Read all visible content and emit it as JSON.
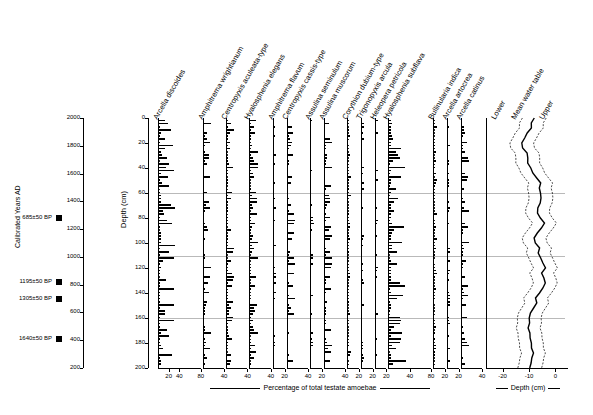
{
  "chart_data": {
    "type": "bar",
    "title": "",
    "subtitle": "",
    "ylabel": "Depth (cm)",
    "ylabel_secondary": "Calibrated Years AD",
    "xlabel_main": "Percentage of total testate amoebae",
    "xlabel_right": "Depth (cm)",
    "ylim": [
      0,
      200
    ],
    "yticks": [
      0,
      20,
      40,
      60,
      80,
      100,
      120,
      140,
      160,
      180,
      200
    ],
    "year_ticks": [
      2000,
      1800,
      1600,
      1400,
      1200,
      1000,
      800,
      600,
      400,
      200
    ],
    "gridlines_depth": [
      60,
      110,
      160
    ],
    "taxa": [
      {
        "name": "Arcella discoides",
        "xmax": 80,
        "xticks": [
          20,
          40,
          80
        ]
      },
      {
        "name": "Amphitrema wrightianum",
        "xmax": 40,
        "xticks": [
          40
        ]
      },
      {
        "name": "Centropyxis aculeata-type",
        "xmax": 40,
        "xticks": [
          40
        ]
      },
      {
        "name": "Hyalosphenia elegans",
        "xmax": 40,
        "xticks": [
          40
        ]
      },
      {
        "name": "Amphitrema flavum",
        "xmax": 20,
        "xticks": [
          20
        ]
      },
      {
        "name": "Centropyxis cassis-type",
        "xmax": 40,
        "xticks": [
          40
        ]
      },
      {
        "name": "Assulina seminulum",
        "xmax": 20,
        "xticks": [
          20
        ]
      },
      {
        "name": "Assulina muscorum",
        "xmax": 40,
        "xticks": [
          40
        ]
      },
      {
        "name": "Corythion dubium-type",
        "xmax": 20,
        "xticks": [
          20
        ]
      },
      {
        "name": "Trigonopyxis arcula",
        "xmax": 20,
        "xticks": [
          20
        ]
      },
      {
        "name": "Heleopera petricola",
        "xmax": 20,
        "xticks": [
          20
        ]
      },
      {
        "name": "Hyalosphenia subflava",
        "xmax": 80,
        "xticks": [
          40,
          80
        ]
      },
      {
        "name": "Bullinularia indica",
        "xmax": 20,
        "xticks": [
          20
        ]
      },
      {
        "name": "Arcella artocrea",
        "xmax": 20,
        "xticks": [
          20
        ]
      },
      {
        "name": "Arcella catinus",
        "xmax": 40,
        "xticks": [
          40
        ]
      }
    ],
    "water_table": {
      "series": [
        "Lower",
        "Mean water table",
        "Upper"
      ],
      "xticks": [
        -20,
        -10,
        0
      ],
      "xlabel": "Depth (cm)"
    },
    "radiocarbon_dates": [
      {
        "label": "685±50 BP",
        "depth_year": 1280
      },
      {
        "label": "1195±50 BP",
        "depth_year": 820
      },
      {
        "label": "1305±50 BP",
        "depth_year": 700
      },
      {
        "label": "1640±50 BP",
        "depth_year": 410
      }
    ]
  },
  "axes": {
    "depth_axis_label": "Depth (cm)",
    "year_axis_label": "Calibrated Years AD",
    "footer_main": "Percentage of total testate amoebae",
    "footer_right": "Depth (cm)"
  }
}
